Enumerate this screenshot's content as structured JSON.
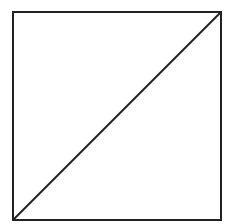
{
  "diagram": {
    "background": "#ffffff",
    "stroke_color": "#222222",
    "stroke_width": 2,
    "square": {
      "x": 13,
      "y": 12,
      "width": 208,
      "height": 208
    },
    "diagonal": {
      "from": "bottom-left",
      "to": "top-right",
      "x1": 13,
      "y1": 220,
      "x2": 221,
      "y2": 12
    }
  }
}
